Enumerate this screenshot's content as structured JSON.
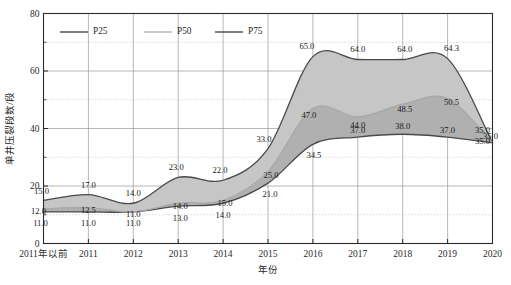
{
  "chart_data": {
    "type": "area",
    "title": "",
    "xlabel": "年份",
    "ylabel": "单井压裂段数/段",
    "ylim": [
      0,
      80
    ],
    "ytick_labels": [
      "0",
      "20",
      "40",
      "60",
      "80"
    ],
    "yticks": [
      0,
      20,
      40,
      60,
      80
    ],
    "yminor_ticks": [
      10,
      30,
      50,
      70
    ],
    "grid": true,
    "legend_position": "top-left-inside",
    "categories": [
      "2011年以前",
      "2011",
      "2012",
      "2013",
      "2014",
      "2015",
      "2016",
      "2017",
      "2018",
      "2019",
      "2020"
    ],
    "series": [
      {
        "name": "P25",
        "color": "#4a4a4a",
        "values": [
          11.0,
          11.0,
          11.0,
          13.0,
          14.0,
          21.0,
          34.5,
          37.0,
          38.0,
          37.0,
          35.0
        ],
        "labels": [
          "11.0",
          "11.0",
          "11.0",
          "13.0",
          "14.0",
          "21.0",
          "34.5",
          "37.0",
          "38.0",
          "37.0",
          "35.0"
        ]
      },
      {
        "name": "P50",
        "color": "#a8a8a8",
        "values": [
          12.0,
          12.5,
          11.0,
          14.0,
          15.0,
          25.0,
          47.0,
          44.0,
          48.5,
          50.5,
          35.0
        ],
        "labels": [
          "12.0",
          "12.5",
          "11.0",
          "14.0",
          "15.0",
          "25.0",
          "47.0",
          "44.0",
          "48.5",
          "50.5",
          "35.0"
        ]
      },
      {
        "name": "P75",
        "color": "#4a4a4a",
        "values": [
          15.0,
          17.0,
          14.0,
          23.0,
          22.0,
          33.0,
          65.0,
          64.0,
          64.0,
          64.3,
          35.0
        ],
        "labels": [
          "15.0",
          "17.0",
          "14.0",
          "23.0",
          "22.0",
          "33.0",
          "65.0",
          "64.0",
          "64.0",
          "64.3",
          "35.0"
        ]
      }
    ],
    "legend": [
      {
        "label": "P25",
        "style": "dark"
      },
      {
        "label": "P50",
        "style": "light"
      },
      {
        "label": "P75",
        "style": "dark"
      }
    ],
    "band_colors": {
      "p25_p50": "#b0b0b0",
      "p50_p75": "#c6c6c6"
    }
  }
}
